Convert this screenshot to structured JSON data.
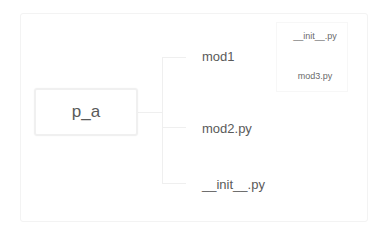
{
  "diagram": {
    "type": "mind-map",
    "root": {
      "label": "p_a"
    },
    "children": [
      {
        "label": "mod1",
        "children": [
          {
            "label": "__init__.py"
          },
          {
            "label": "mod3.py"
          }
        ]
      },
      {
        "label": "mod2.py"
      },
      {
        "label": "__init__.py"
      }
    ]
  },
  "colors": {
    "background": "#ffffff",
    "text": "#5a5a5a",
    "connector": "#efefef",
    "border": "#f0f0f0"
  }
}
